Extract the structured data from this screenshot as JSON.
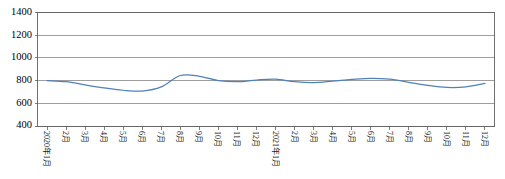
{
  "chart_data": {
    "type": "line",
    "title": "",
    "xlabel": "",
    "ylabel": "",
    "ylim": [
      400,
      1400
    ],
    "yticks": [
      400,
      600,
      800,
      1000,
      1200,
      1400
    ],
    "grid": true,
    "legend": "none",
    "line_color": "#4f81bd",
    "categories": [
      "2020年1月",
      "2月",
      "3月",
      "4月",
      "5月",
      "6月",
      "7月",
      "8月",
      "9月",
      "10月",
      "11月",
      "12月",
      "2021年1月",
      "2月",
      "3月",
      "4月",
      "5月",
      "6月",
      "7月",
      "8月",
      "9月",
      "10月",
      "11月",
      "12月"
    ],
    "series": [
      {
        "name": "价格",
        "values": [
          800,
          790,
          762,
          735,
          715,
          708,
          745,
          845,
          838,
          800,
          790,
          805,
          812,
          790,
          782,
          795,
          810,
          820,
          812,
          785,
          758,
          740,
          745,
          775
        ]
      }
    ]
  },
  "axis": {
    "y_tick_labels": [
      "1400",
      "1200",
      "1000",
      "800",
      "600",
      "400"
    ]
  }
}
